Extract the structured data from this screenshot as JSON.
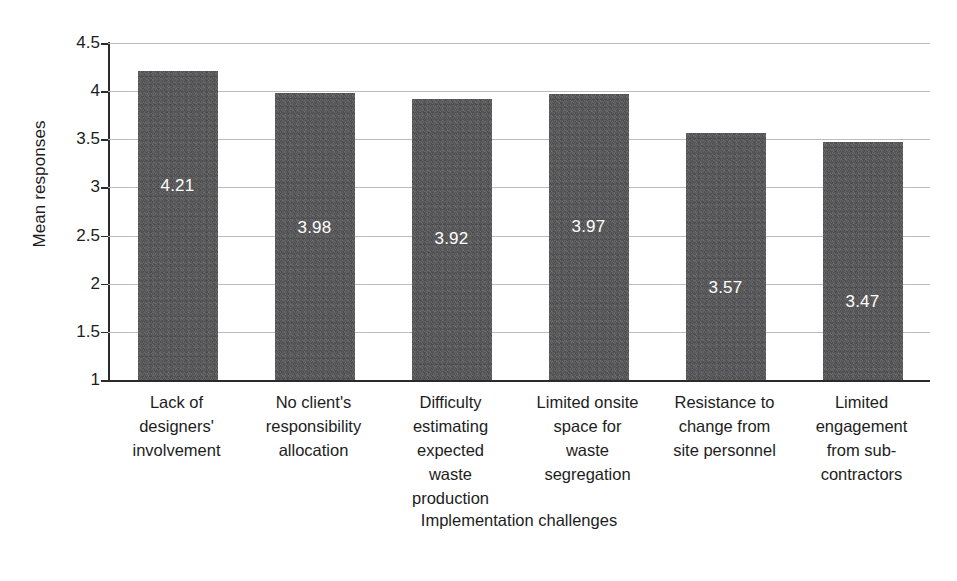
{
  "chart_data": {
    "type": "bar",
    "title": "",
    "xlabel": "Implementation challenges",
    "ylabel": "Mean responses",
    "ylim": [
      1,
      4.5
    ],
    "yticks": [
      "1",
      "1.5",
      "2",
      "2.5",
      "3",
      "3.5",
      "4",
      "4.5"
    ],
    "ytick_values": [
      1,
      1.5,
      2,
      2.5,
      3,
      3.5,
      4,
      4.5
    ],
    "grid": true,
    "legend": "none",
    "bar_color": "#575759",
    "value_label_color": "#ffffff",
    "categories": [
      "Lack of designers' involvement",
      "No client's responsibility allocation",
      "Difficulty estimating expected waste production",
      "Limited onsite space for waste segregation",
      "Resistance to change from site personnel",
      "Limited engagement from sub-contractors"
    ],
    "category_lines": [
      [
        "Lack of",
        "designers'",
        "involvement"
      ],
      [
        "No client's",
        "responsibility",
        "allocation"
      ],
      [
        "Difficulty",
        "estimating",
        "expected",
        "waste",
        "production"
      ],
      [
        "Limited onsite",
        "space for",
        "waste",
        "segregation"
      ],
      [
        "Resistance to",
        "change from",
        "site personnel"
      ],
      [
        "Limited",
        "engagement",
        "from sub-",
        "contractors"
      ]
    ],
    "values": [
      4.21,
      3.98,
      3.92,
      3.97,
      3.57,
      3.47
    ],
    "value_labels": [
      "4.21",
      "3.98",
      "3.92",
      "3.97",
      "3.57",
      "3.47"
    ]
  },
  "caption_remnant": ""
}
